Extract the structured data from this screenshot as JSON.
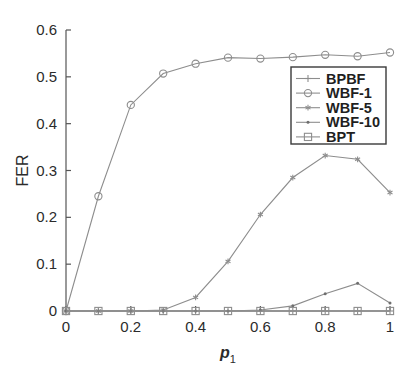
{
  "chart_data": {
    "type": "line",
    "title": "",
    "xlabel": "p_1",
    "xlabel_base": "p",
    "xlabel_sub": "1",
    "ylabel": "FER",
    "xlim": [
      0,
      1
    ],
    "ylim": [
      0,
      0.6
    ],
    "grid": false,
    "legend_position": "center-right",
    "x": [
      0,
      0.1,
      0.2,
      0.3,
      0.4,
      0.5,
      0.6,
      0.7,
      0.8,
      0.9,
      1
    ],
    "xticks": [
      0,
      0.2,
      0.4,
      0.6,
      0.8,
      1
    ],
    "xticklabels": [
      "0",
      "0.2",
      "0.4",
      "0.6",
      "0.8",
      "1"
    ],
    "yticks": [
      0,
      0.1,
      0.2,
      0.3,
      0.4,
      0.5,
      0.6
    ],
    "yticklabels": [
      "0",
      "0.1",
      "0.2",
      "0.3",
      "0.4",
      "0.5",
      "0.6"
    ],
    "series": [
      {
        "name": "BPBF",
        "marker": "plus",
        "color": "#8d8d8d",
        "values": [
          0,
          0,
          0,
          0,
          0,
          0,
          0,
          0,
          0,
          0,
          0
        ]
      },
      {
        "name": "WBF-1",
        "marker": "circle",
        "color": "#8d8d8d",
        "values": [
          0,
          0.245,
          0.44,
          0.507,
          0.528,
          0.541,
          0.539,
          0.542,
          0.547,
          0.544,
          0.552
        ]
      },
      {
        "name": "WBF-5",
        "marker": "asterisk",
        "color": "#8d8d8d",
        "values": [
          0,
          0,
          0,
          0.002,
          0.029,
          0.106,
          0.206,
          0.285,
          0.332,
          0.324,
          0.253
        ]
      },
      {
        "name": "WBF-10",
        "marker": "dot",
        "color": "#8d8d8d",
        "values": [
          0,
          0,
          0,
          0,
          0,
          0,
          0.002,
          0.011,
          0.037,
          0.059,
          0.017
        ]
      },
      {
        "name": "BPT",
        "marker": "square",
        "color": "#8d8d8d",
        "values": [
          0,
          0,
          0,
          0,
          0,
          0,
          0,
          0,
          0,
          0,
          0
        ]
      }
    ]
  },
  "legend": {
    "items": [
      {
        "label": "BPBF"
      },
      {
        "label": "WBF-1"
      },
      {
        "label": "WBF-5"
      },
      {
        "label": "WBF-10"
      },
      {
        "label": "BPT"
      }
    ]
  },
  "axes": {
    "y_title": "FER",
    "x_title_base": "p",
    "x_title_sub": "1"
  }
}
